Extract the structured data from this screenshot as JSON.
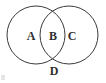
{
  "figure": {
    "type": "venn-diagram",
    "background_color": "#ffffff",
    "stroke_color": "#3a3a3a",
    "label_color": "#2e2e2e",
    "stroke_width": 1,
    "circles": [
      {
        "id": "left-circle",
        "name": "left-set-circle",
        "cx": 36,
        "cy": 35,
        "r": 29
      },
      {
        "id": "right-circle",
        "name": "right-set-circle",
        "cx": 69,
        "cy": 35,
        "r": 29
      }
    ],
    "labels": [
      {
        "id": "A",
        "text": "A",
        "region": "left-only",
        "x": 31,
        "y": 36
      },
      {
        "id": "B",
        "text": "B",
        "region": "intersection",
        "x": 53,
        "y": 36
      },
      {
        "id": "C",
        "text": "C",
        "region": "right-only",
        "x": 72,
        "y": 36
      },
      {
        "id": "D",
        "text": "D",
        "region": "below-lower-intersection",
        "x": 54,
        "y": 71
      }
    ],
    "artifact": {
      "name": "corner-smudge",
      "description": "faint gray scan artifact",
      "color": "#cfcfcf"
    }
  }
}
